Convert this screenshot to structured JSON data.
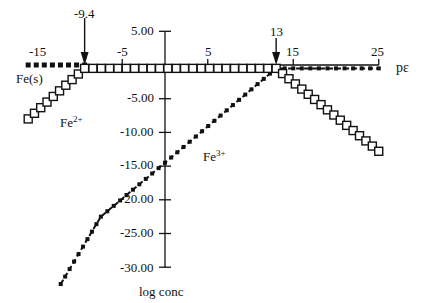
{
  "chart_data": {
    "type": "line",
    "title": "",
    "xlabel": "pε",
    "ylabel": "log conc",
    "xlim": [
      -16,
      25
    ],
    "ylim": [
      -30,
      5
    ],
    "x_ticks": [
      -15,
      -5,
      5,
      15,
      25
    ],
    "y_ticks": [
      "5.00",
      "-5.00",
      "-10.00",
      "-15.00",
      "-20.00",
      "-25.00",
      "-30.00"
    ],
    "grid": false,
    "legend": "none (inline labels)",
    "annotations": [
      {
        "text": "-9.4",
        "x": -9.4,
        "type": "arrow-down"
      },
      {
        "text": "13",
        "x": 13,
        "type": "arrow-down"
      }
    ],
    "series": [
      {
        "name": "Fe(s)",
        "style": "dotted-square-markers",
        "points": [
          [
            -16,
            0
          ],
          [
            -9.4,
            0
          ]
        ]
      },
      {
        "name": "Fe2+",
        "style": "open-squares",
        "points": [
          [
            -16,
            -8.0
          ],
          [
            -9.4,
            -0.5
          ],
          [
            13,
            -0.5
          ],
          [
            25,
            -12.8
          ]
        ]
      },
      {
        "name": "Fe3+",
        "style": "dash-dot-markers",
        "points": [
          [
            -12.2,
            -32.5
          ],
          [
            -7.5,
            -22.5
          ],
          [
            0,
            -14.5
          ],
          [
            13,
            -0.5
          ],
          [
            25,
            -0.5
          ]
        ]
      }
    ]
  },
  "labels": {
    "x_axis": "pε",
    "y_axis": "log conc",
    "arrow_left": "-9.4",
    "arrow_right": "13",
    "fe_s": "Fe(s)",
    "fe2_base": "Fe",
    "fe2_sup": "2+",
    "fe3_base": "Fe",
    "fe3_sup": "3+",
    "xt": [
      "-15",
      "-5",
      "5",
      "15",
      "25"
    ],
    "yt": [
      "5.00",
      "-5.00",
      "-10.00",
      "-15.00",
      "-20.00",
      "-25.00",
      "-30.00"
    ]
  }
}
